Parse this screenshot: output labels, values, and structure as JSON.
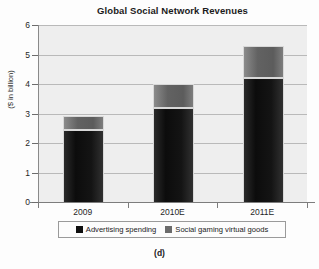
{
  "figure": {
    "caption": "(d)"
  },
  "chart_data": {
    "type": "bar",
    "subtype": "stacked-bar",
    "title": "Global Social Network Revenues",
    "xlabel": "",
    "ylabel": "($ in billion)",
    "categories": [
      "2009",
      "2010E",
      "2011E"
    ],
    "series": [
      {
        "name": "Advertising spending",
        "color": "#0e0e0e",
        "values": [
          2.45,
          3.2,
          4.2
        ]
      },
      {
        "name": "Social gaming virtual goods",
        "color": "#6b6b6b",
        "values": [
          0.48,
          0.8,
          1.1
        ]
      }
    ],
    "totals": [
      2.93,
      4.0,
      5.3
    ],
    "ylim": [
      0,
      6
    ],
    "yticks": [
      "0",
      "1",
      "2",
      "3",
      "4",
      "5",
      "6"
    ],
    "grid": true,
    "legend_position": "bottom"
  }
}
